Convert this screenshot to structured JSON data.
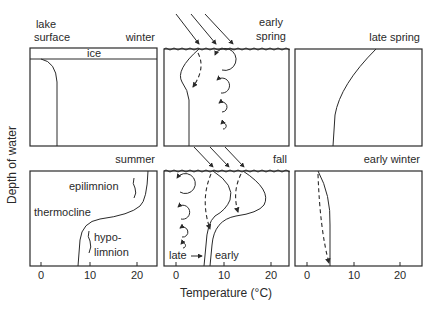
{
  "figure": {
    "y_axis_label": "Depth of water",
    "x_axis_label": "Temperature (°C)",
    "x_ticks": [
      "0",
      "10",
      "20"
    ],
    "annotation_lake_surface_1": "lake",
    "annotation_lake_surface_2": "surface",
    "panels": [
      {
        "id": "winter",
        "title": "winter",
        "labels": {
          "ice": "ice"
        }
      },
      {
        "id": "early-spring",
        "title_1": "early",
        "title_2": "spring"
      },
      {
        "id": "late-spring",
        "title": "late spring"
      },
      {
        "id": "summer",
        "title": "summer",
        "labels": {
          "epilimnion": "epilimnion",
          "thermocline": "thermocline",
          "hypo": "hypo-",
          "limnion": "limnion"
        }
      },
      {
        "id": "fall",
        "title": "fall",
        "labels": {
          "late": "late",
          "early": "early"
        }
      },
      {
        "id": "early-winter",
        "title": "early winter"
      }
    ]
  }
}
